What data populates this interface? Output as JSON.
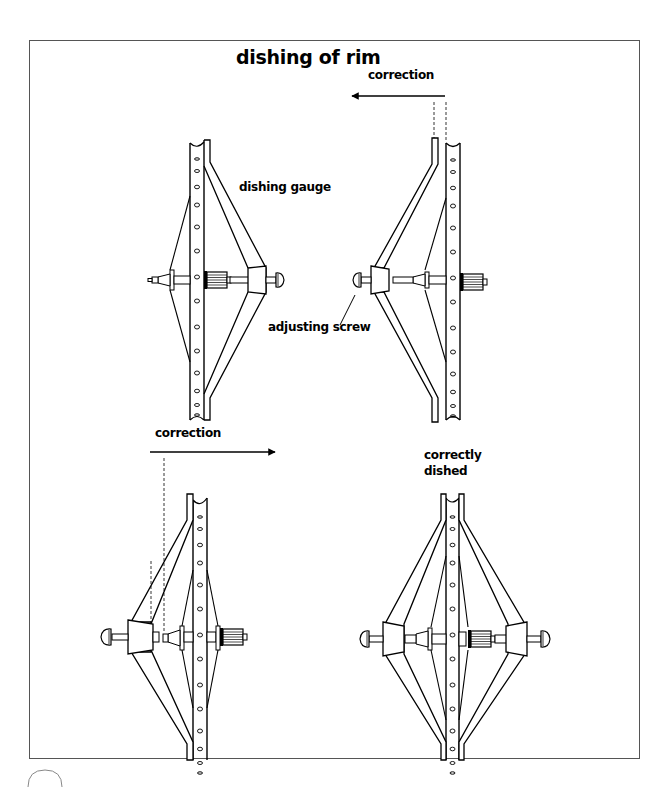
{
  "figure": {
    "title": "dishing of rim",
    "labels": {
      "correction_top": "correction",
      "dishing_gauge": "dishing gauge",
      "adjusting_screw": "adjusting screw",
      "correction_bottom": "correction",
      "correctly_dished_line1": "correctly",
      "correctly_dished_line2": "dished"
    },
    "panels": [
      {
        "id": "top-left",
        "description": "dishing gauge placed on right side of wheel, spanning rim to axle"
      },
      {
        "id": "top-right",
        "description": "wheel flipped, gauge on left side; rim offset shows correction needed to the left"
      },
      {
        "id": "bottom-left",
        "description": "gauge on left shows gap to axle; correction needed to the right"
      },
      {
        "id": "bottom-right",
        "description": "correctly dished wheel with gauge symmetric on both sides"
      }
    ],
    "arrows": [
      {
        "label": "correction",
        "direction": "left"
      },
      {
        "label": "correction",
        "direction": "right"
      }
    ],
    "colors": {
      "line": "#000000",
      "background": "#ffffff",
      "frame": "#555555"
    }
  }
}
